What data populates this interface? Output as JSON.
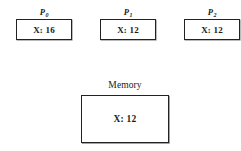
{
  "figure": {
    "type": "cache-coherence-diagram",
    "background_color": "#ffffff",
    "border_color": "#222222"
  },
  "processes": [
    {
      "id": "p0",
      "label_base": "P",
      "label_subscript": "0",
      "value": "X: 16"
    },
    {
      "id": "p1",
      "label_base": "P",
      "label_subscript": "1",
      "value": "X: 12"
    },
    {
      "id": "p2",
      "label_base": "P",
      "label_subscript": "2",
      "value": "X: 12"
    }
  ],
  "memory": {
    "label": "Memory",
    "value": "X: 12"
  }
}
